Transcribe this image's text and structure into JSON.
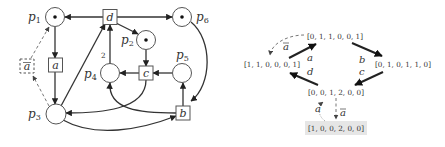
{
  "petri_net": {
    "places": [
      {
        "id": "p1",
        "label": "p",
        "sub": "1",
        "tokens": 1
      },
      {
        "id": "p2",
        "label": "p",
        "sub": "2",
        "tokens": 1
      },
      {
        "id": "p3",
        "label": "p",
        "sub": "3",
        "tokens": 0
      },
      {
        "id": "p4",
        "label": "p",
        "sub": "4",
        "tokens": 0
      },
      {
        "id": "p5",
        "label": "p",
        "sub": "5",
        "tokens": 0
      },
      {
        "id": "p6",
        "label": "p",
        "sub": "6",
        "tokens": 1
      }
    ],
    "transitions": [
      {
        "id": "a",
        "label": "a"
      },
      {
        "id": "abar",
        "label": "a",
        "overline": true,
        "dashed": true
      },
      {
        "id": "b",
        "label": "b"
      },
      {
        "id": "c",
        "label": "c"
      },
      {
        "id": "d",
        "label": "d"
      }
    ],
    "arc_weight_label": "2"
  },
  "reachability_graph": {
    "nodes": [
      {
        "id": "m0",
        "label": "[0, 1, 1, 0, 0, 1]"
      },
      {
        "id": "m1",
        "label": "[1, 1, 0, 0, 0, 1]"
      },
      {
        "id": "m2",
        "label": "[0, 1, 0, 1, 1, 0]"
      },
      {
        "id": "m3",
        "label": "[0, 0, 1, 2, 0, 0]"
      },
      {
        "id": "m4",
        "label": "[1, 0, 0, 2, 0, 0]",
        "highlighted": true
      }
    ],
    "edges": [
      {
        "from": "m0",
        "to": "m1",
        "label": "a",
        "overline": true,
        "dashed": true
      },
      {
        "from": "m1",
        "to": "m0",
        "label": "a"
      },
      {
        "from": "m0",
        "to": "m2",
        "label": "b"
      },
      {
        "from": "m2",
        "to": "m3",
        "label": "c"
      },
      {
        "from": "m3",
        "to": "m1",
        "label": "d"
      },
      {
        "from": "m3",
        "to": "m4",
        "label": "a",
        "overline": true,
        "dashed": true
      },
      {
        "from": "m4",
        "to": "m3",
        "label": "a",
        "dotted": true
      }
    ],
    "highlight_color": "#e6e6e6"
  }
}
